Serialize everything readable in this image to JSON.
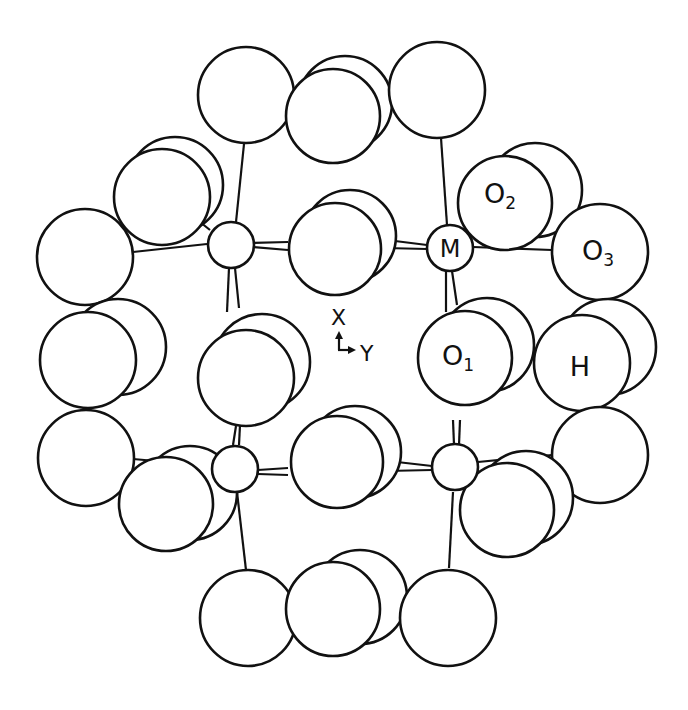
{
  "figure": {
    "title": "",
    "type": "crystal-structure projection",
    "labels": {
      "metal": "M",
      "o1_main": "O",
      "o1_sub": "1",
      "o2_main": "O",
      "o2_sub": "2",
      "o3_main": "O",
      "o3_sub": "3",
      "hydrogen": "H"
    },
    "axes": {
      "x_label": "X",
      "y_label": "Y"
    },
    "colors": {
      "stroke": "#111111",
      "fill": "#ffffff",
      "background": "#ffffff"
    }
  }
}
